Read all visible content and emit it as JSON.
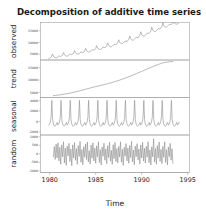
{
  "chart_data": {
    "type": "line",
    "title": "Decomposition of additive time series",
    "xlabel": "Time",
    "ylabel": "",
    "grid": false,
    "legend": null,
    "xlim": [
      1979.0,
      1995.2
    ],
    "xticks": [
      1980,
      1985,
      1990,
      1995
    ],
    "xticklabels": [
      "1980",
      "1985",
      "1990",
      "1995"
    ],
    "panels": [
      {
        "name": "observed",
        "label": "observed",
        "ylim": [
          2500,
          18500
        ],
        "yticks": [
          5000,
          10000,
          15000
        ],
        "yticklabels": [
          "5000",
          "10000",
          "15000"
        ],
        "x": [
          1979.9,
          1980.0,
          1980.1,
          1980.2,
          1980.3,
          1980.4,
          1980.5,
          1980.6,
          1980.7,
          1980.8,
          1980.9,
          1981.0,
          1981.1,
          1981.2,
          1981.3,
          1981.4,
          1981.5,
          1981.6,
          1981.7,
          1981.8,
          1981.9,
          1982.0,
          1982.1,
          1982.2,
          1982.3,
          1982.4,
          1982.5,
          1982.6,
          1982.7,
          1982.8,
          1982.9,
          1983.0,
          1983.1,
          1983.2,
          1983.3,
          1983.4,
          1983.5,
          1983.6,
          1983.7,
          1983.8,
          1983.9,
          1984.0,
          1984.1,
          1984.2,
          1984.3,
          1984.4,
          1984.5,
          1984.6,
          1984.7,
          1984.8,
          1984.9,
          1985.0,
          1985.1,
          1985.2,
          1985.3,
          1985.4,
          1985.5,
          1985.6,
          1985.7,
          1985.8,
          1985.9,
          1986.0,
          1986.1,
          1986.2,
          1986.3,
          1986.4,
          1986.5,
          1986.6,
          1986.7,
          1986.8,
          1986.9,
          1987.0,
          1987.1,
          1987.2,
          1987.3,
          1987.4,
          1987.5,
          1987.6,
          1987.7,
          1987.8,
          1987.9,
          1988.0,
          1988.1,
          1988.2,
          1988.3,
          1988.4,
          1988.5,
          1988.6,
          1988.7,
          1988.8,
          1988.9,
          1989.0,
          1989.1,
          1989.2,
          1989.3,
          1989.4,
          1989.5,
          1989.6,
          1989.7,
          1989.8,
          1989.9,
          1990.0,
          1990.1,
          1990.2,
          1990.3,
          1990.4,
          1990.5,
          1990.6,
          1990.7,
          1990.8,
          1990.9,
          1991.0,
          1991.1,
          1991.2,
          1991.3,
          1991.4,
          1991.5,
          1991.6,
          1991.7,
          1991.8,
          1991.9,
          1992.0,
          1992.1,
          1992.2,
          1992.3,
          1992.4,
          1992.5,
          1992.6,
          1992.7,
          1992.8,
          1992.9,
          1993.0,
          1993.1,
          1993.2,
          1993.3,
          1993.4,
          1993.5,
          1993.6,
          1993.7,
          1993.8,
          1993.9,
          1994.0
        ],
        "values": [
          3050,
          3250,
          3500,
          4050,
          5100,
          4250,
          3700,
          3500,
          3400,
          3550,
          3900,
          4250,
          4150,
          4000,
          4200,
          4600,
          5650,
          4850,
          4350,
          4150,
          4150,
          4350,
          4700,
          5050,
          4900,
          4800,
          5000,
          5400,
          6500,
          5700,
          5200,
          5000,
          5000,
          5200,
          5550,
          5900,
          5800,
          5700,
          5900,
          6350,
          7500,
          6650,
          6150,
          5950,
          5950,
          6150,
          6500,
          6900,
          6800,
          6700,
          6900,
          7400,
          8600,
          7700,
          7200,
          7000,
          7000,
          7200,
          7600,
          8000,
          7900,
          7800,
          8050,
          8550,
          9800,
          8850,
          8350,
          8150,
          8150,
          8400,
          8800,
          9200,
          9100,
          9050,
          9300,
          9850,
          11150,
          10150,
          9650,
          9450,
          9500,
          9750,
          10150,
          10600,
          10500,
          10450,
          10750,
          11350,
          12750,
          11700,
          11150,
          10950,
          11000,
          11300,
          11750,
          12200,
          12100,
          12100,
          12400,
          13050,
          14550,
          13450,
          12900,
          12700,
          12750,
          13050,
          13500,
          14000,
          13900,
          13900,
          14250,
          14950,
          16500,
          15350,
          14800,
          14600,
          14650,
          14950,
          15400,
          15900,
          15800,
          15850,
          16200,
          16900,
          18400,
          17250,
          16700,
          16500,
          16550,
          16850,
          17250,
          17700,
          17600,
          17650,
          17950,
          18550,
          18350,
          18100,
          17900,
          17800,
          17850,
          18050,
          18300
        ]
      },
      {
        "name": "trend",
        "label": "trend",
        "ylim": [
          3000,
          18000
        ],
        "yticks": [
          5000,
          10000,
          15000
        ],
        "yticklabels": [
          "5000",
          "10000",
          "15000"
        ],
        "x": [
          1980.4,
          1981.0,
          1981.6,
          1982.2,
          1982.8,
          1983.4,
          1984.0,
          1984.6,
          1985.2,
          1985.8,
          1986.4,
          1987.0,
          1987.6,
          1988.2,
          1988.8,
          1989.4,
          1990.0,
          1990.6,
          1991.2,
          1991.8,
          1992.2,
          1992.6,
          1993.0,
          1993.4
        ],
        "values": [
          3750,
          4000,
          4350,
          4750,
          5250,
          5800,
          6400,
          7000,
          7550,
          8050,
          8600,
          9250,
          9950,
          10750,
          11600,
          12500,
          13450,
          14400,
          15350,
          16200,
          16750,
          17100,
          17300,
          17420
        ]
      },
      {
        "name": "seasonal",
        "label": "seasonal",
        "ylim": [
          -2600,
          4600
        ],
        "yticks": [
          -2000,
          0,
          2000,
          4000
        ],
        "yticklabels": [
          "-2000",
          "0",
          "2000",
          "4000"
        ],
        "cycle_start": 1979.9,
        "cycle_end": 1994.1,
        "period": 1.0,
        "cycle_values": [
          -700,
          -480,
          -120,
          820,
          4050,
          350,
          -500,
          -820,
          -930,
          -800,
          -480,
          -180
        ]
      },
      {
        "name": "random",
        "label": "random",
        "ylim": [
          -1100,
          1100
        ],
        "yticks": [
          -1000,
          -500,
          0,
          500,
          1000
        ],
        "yticklabels": [
          "-1000",
          "-500",
          "0",
          "500",
          "1000"
        ],
        "x": [
          1980.4,
          1980.5,
          1980.6,
          1980.7,
          1980.8,
          1980.9,
          1981.0,
          1981.1,
          1981.2,
          1981.3,
          1981.4,
          1981.5,
          1981.6,
          1981.7,
          1981.8,
          1981.9,
          1982.0,
          1982.1,
          1982.2,
          1982.3,
          1982.4,
          1982.5,
          1982.6,
          1982.7,
          1982.8,
          1982.9,
          1983.0,
          1983.1,
          1983.2,
          1983.3,
          1983.4,
          1983.5,
          1983.6,
          1983.7,
          1983.8,
          1983.9,
          1984.0,
          1984.1,
          1984.2,
          1984.3,
          1984.4,
          1984.5,
          1984.6,
          1984.7,
          1984.8,
          1984.9,
          1985.0,
          1985.1,
          1985.2,
          1985.3,
          1985.4,
          1985.5,
          1985.6,
          1985.7,
          1985.8,
          1985.9,
          1986.0,
          1986.1,
          1986.2,
          1986.3,
          1986.4,
          1986.5,
          1986.6,
          1986.7,
          1986.8,
          1986.9,
          1987.0,
          1987.1,
          1987.2,
          1987.3,
          1987.4,
          1987.5,
          1987.6,
          1987.7,
          1987.8,
          1987.9,
          1988.0,
          1988.1,
          1988.2,
          1988.3,
          1988.4,
          1988.5,
          1988.6,
          1988.7,
          1988.8,
          1988.9,
          1989.0,
          1989.1,
          1989.2,
          1989.3,
          1989.4,
          1989.5,
          1989.6,
          1989.7,
          1989.8,
          1989.9,
          1990.0,
          1990.1,
          1990.2,
          1990.3,
          1990.4,
          1990.5,
          1990.6,
          1990.7,
          1990.8,
          1990.9,
          1991.0,
          1991.1,
          1991.2,
          1991.3,
          1991.4,
          1991.5,
          1991.6,
          1991.7,
          1991.8,
          1991.9,
          1992.0,
          1992.1,
          1992.2,
          1992.3,
          1992.4,
          1992.5,
          1992.6,
          1992.7,
          1992.8,
          1992.9,
          1993.0,
          1993.1,
          1993.2,
          1993.3,
          1993.4
        ],
        "values": [
          -180,
          420,
          -330,
          560,
          -250,
          640,
          -420,
          380,
          -620,
          520,
          -180,
          700,
          -540,
          330,
          -680,
          450,
          -120,
          610,
          -460,
          280,
          -700,
          520,
          -240,
          660,
          -380,
          300,
          -620,
          480,
          -160,
          720,
          -500,
          250,
          -640,
          420,
          -200,
          580,
          -340,
          690,
          -480,
          180,
          -600,
          510,
          -260,
          640,
          -420,
          330,
          -560,
          460,
          -180,
          700,
          -520,
          240,
          -660,
          400,
          -150,
          620,
          -380,
          290,
          -580,
          470,
          -220,
          680,
          -440,
          200,
          -620,
          530,
          -280,
          660,
          -460,
          310,
          -540,
          430,
          -190,
          700,
          -500,
          260,
          -680,
          380,
          -140,
          600,
          -420,
          340,
          -560,
          490,
          -230,
          720,
          -480,
          210,
          -640,
          450,
          -170,
          590,
          -360,
          280,
          -600,
          520,
          -250,
          670,
          -430,
          320,
          -550,
          440,
          -200,
          700,
          -520,
          230,
          -660,
          410,
          -180,
          880,
          -480,
          300,
          -620,
          470,
          -240,
          690,
          -450,
          260,
          -580,
          430,
          -210,
          700,
          -510,
          240,
          -650,
          400,
          -170,
          610,
          -380,
          290,
          -560
        ]
      }
    ]
  },
  "axis": {
    "xlabel": "Time"
  }
}
